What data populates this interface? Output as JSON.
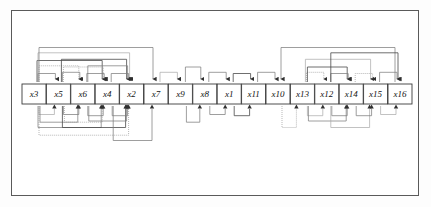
{
  "figure": {
    "background_color": "#ffffff",
    "frame_color": "#5a5a5a",
    "node_fill": "#ffffff",
    "node_stroke": "#3a3a3a",
    "edge_color": "#7d7d7d",
    "arrow_color": "#2f2f2f"
  },
  "graph": {
    "type": "directed-acyclic-graph",
    "layout": "single-row",
    "node_count": 16,
    "edge_count": 62,
    "nodes": [
      {
        "id": "x3",
        "label": "x3",
        "x": 34,
        "y": 94,
        "order": 1
      },
      {
        "id": "x5",
        "label": "x5",
        "x": 61,
        "y": 94,
        "order": 2
      },
      {
        "id": "x6",
        "label": "x6",
        "x": 88,
        "y": 94,
        "order": 3
      },
      {
        "id": "x4",
        "label": "x4",
        "x": 115,
        "y": 94,
        "order": 4
      },
      {
        "id": "x2",
        "label": "x2",
        "x": 142,
        "y": 94,
        "order": 5
      },
      {
        "id": "x7",
        "label": "x7",
        "x": 169,
        "y": 94,
        "order": 6
      },
      {
        "id": "x9",
        "label": "x9",
        "x": 196,
        "y": 94,
        "order": 7
      },
      {
        "id": "x8",
        "label": "x8",
        "x": 223,
        "y": 94,
        "order": 8
      },
      {
        "id": "x1",
        "label": "x1",
        "x": 250,
        "y": 94,
        "order": 9
      },
      {
        "id": "x11",
        "label": "x11",
        "x": 277,
        "y": 94,
        "order": 10
      },
      {
        "id": "x10",
        "label": "x10",
        "x": 304,
        "y": 94,
        "order": 11
      },
      {
        "id": "x13",
        "label": "x13",
        "x": 331,
        "y": 94,
        "order": 12
      },
      {
        "id": "x12",
        "label": "x12",
        "x": 358,
        "y": 94,
        "order": 13
      },
      {
        "id": "x14",
        "label": "x14",
        "x": 385,
        "y": 94,
        "order": 14
      },
      {
        "id": "x15",
        "label": "x15",
        "x": 412,
        "y": 94,
        "order": 15
      },
      {
        "id": "x16",
        "label": "x16",
        "x": 439,
        "y": 94,
        "order": 16
      }
    ],
    "node_order": [
      "x3",
      "x5",
      "x6",
      "x4",
      "x2",
      "x7",
      "x9",
      "x8",
      "x1",
      "x11",
      "x10",
      "x13",
      "x12",
      "x14",
      "x15",
      "x16"
    ],
    "clusters": [
      {
        "name": "left-cluster",
        "members": [
          "x3",
          "x5",
          "x6",
          "x4",
          "x2"
        ],
        "density": "high"
      },
      {
        "name": "middle-cluster",
        "members": [
          "x7",
          "x9",
          "x8",
          "x1",
          "x11",
          "x10"
        ],
        "density": "low"
      },
      {
        "name": "right-cluster",
        "members": [
          "x13",
          "x12",
          "x14",
          "x15",
          "x16"
        ],
        "density": "high"
      }
    ],
    "edges_above": [
      {
        "from": "x3",
        "to": "x5",
        "depth": 1
      },
      {
        "from": "x3",
        "to": "x6",
        "depth": 2
      },
      {
        "from": "x3",
        "to": "x4",
        "depth": 3
      },
      {
        "from": "x3",
        "to": "x2",
        "depth": 4
      },
      {
        "from": "x3",
        "to": "x7",
        "depth": 5
      },
      {
        "from": "x5",
        "to": "x6",
        "depth": 1
      },
      {
        "from": "x5",
        "to": "x4",
        "depth": 2
      },
      {
        "from": "x5",
        "to": "x2",
        "depth": 3
      },
      {
        "from": "x6",
        "to": "x4",
        "depth": 1
      },
      {
        "from": "x6",
        "to": "x2",
        "depth": 2
      },
      {
        "from": "x4",
        "to": "x2",
        "depth": 1
      },
      {
        "from": "x7",
        "to": "x9",
        "depth": 1
      },
      {
        "from": "x9",
        "to": "x8",
        "depth": 2
      },
      {
        "from": "x8",
        "to": "x1",
        "depth": 1
      },
      {
        "from": "x1",
        "to": "x11",
        "depth": 1
      },
      {
        "from": "x11",
        "to": "x10",
        "depth": 1
      },
      {
        "from": "x16",
        "to": "x10",
        "depth": 5
      },
      {
        "from": "x13",
        "to": "x12",
        "depth": 1
      },
      {
        "from": "x13",
        "to": "x14",
        "depth": 2
      },
      {
        "from": "x13",
        "to": "x15",
        "depth": 3
      },
      {
        "from": "x12",
        "to": "x14",
        "depth": 1
      },
      {
        "from": "x12",
        "to": "x16",
        "depth": 4
      },
      {
        "from": "x14",
        "to": "x15",
        "depth": 1
      },
      {
        "from": "x15",
        "to": "x16",
        "depth": 1
      }
    ],
    "edges_below": [
      {
        "from": "x3",
        "to": "x5",
        "depth": 1
      },
      {
        "from": "x3",
        "to": "x6",
        "depth": 2
      },
      {
        "from": "x3",
        "to": "x4",
        "depth": 3
      },
      {
        "from": "x3",
        "to": "x2",
        "depth": 4
      },
      {
        "from": "x5",
        "to": "x6",
        "depth": 1
      },
      {
        "from": "x5",
        "to": "x4",
        "depth": 2
      },
      {
        "from": "x5",
        "to": "x2",
        "depth": 3
      },
      {
        "from": "x6",
        "to": "x4",
        "depth": 1
      },
      {
        "from": "x6",
        "to": "x2",
        "depth": 2
      },
      {
        "from": "x4",
        "to": "x2",
        "depth": 1
      },
      {
        "from": "x4",
        "to": "x7",
        "depth": 5
      },
      {
        "from": "x9",
        "to": "x8",
        "depth": 2
      },
      {
        "from": "x8",
        "to": "x1",
        "depth": 1
      },
      {
        "from": "x1",
        "to": "x11",
        "depth": 1
      },
      {
        "from": "x10",
        "to": "x13",
        "depth": 3
      },
      {
        "from": "x13",
        "to": "x12",
        "depth": 1
      },
      {
        "from": "x13",
        "to": "x14",
        "depth": 2
      },
      {
        "from": "x12",
        "to": "x14",
        "depth": 1
      },
      {
        "from": "x12",
        "to": "x15",
        "depth": 3
      },
      {
        "from": "x14",
        "to": "x15",
        "depth": 1
      },
      {
        "from": "x15",
        "to": "x16",
        "depth": 1
      }
    ],
    "node_box": {
      "width": 24,
      "height": 20,
      "gap": 3
    }
  }
}
